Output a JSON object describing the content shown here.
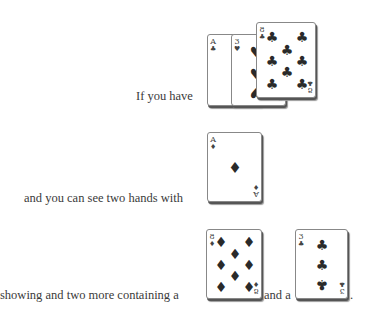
{
  "lines": [
    {
      "text": "If you have"
    },
    {
      "text": "and you can see two hands with"
    },
    {
      "text": "showing and two more containing a"
    },
    {
      "text": "and a"
    },
    {
      "text": "."
    }
  ],
  "cards": {
    "your_hand": [
      {
        "rank": "A",
        "suit": "♣",
        "suit_name": "clubs"
      },
      {
        "rank": "3",
        "suit": "♥",
        "suit_name": "hearts"
      },
      {
        "rank": "8",
        "suit": "♣",
        "suit_name": "clubs"
      }
    ],
    "showing": {
      "rank": "A",
      "suit": "♦",
      "suit_name": "diamonds"
    },
    "other_hand_1": {
      "rank": "8",
      "suit": "♦",
      "suit_name": "diamonds"
    },
    "other_hand_2": {
      "rank": "3",
      "suit": "♣",
      "suit_name": "clubs"
    }
  }
}
